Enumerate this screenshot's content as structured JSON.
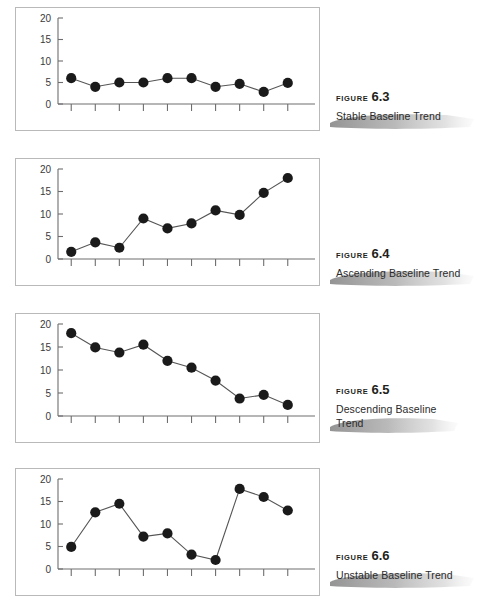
{
  "page": {
    "background_color": "#ffffff",
    "axis_color": "#6e6e6e",
    "frame_color": "#b9b9b9",
    "marker_color": "#1a1a1a",
    "line_color": "#555555",
    "brush_color": "#9a9a9a"
  },
  "figures": [
    {
      "figure_word": "FIGURE",
      "figure_number": "6.3",
      "title_lines": [
        "Stable Baseline Trend"
      ],
      "chart_data": {
        "type": "line",
        "title": "Stable Baseline Trend",
        "xlabel": "",
        "ylabel": "",
        "ylim": [
          0,
          20
        ],
        "yticks": [
          0,
          5,
          10,
          15,
          20
        ],
        "ytick_labels": [
          "0",
          "5",
          "10",
          "15",
          "20"
        ],
        "x": [
          1,
          2,
          3,
          4,
          5,
          6,
          7,
          8,
          9,
          10
        ],
        "xtick_count": 10,
        "xtick_labels": [
          "",
          "",
          "",
          "",
          "",
          "",
          "",
          "",
          "",
          ""
        ],
        "values": [
          6.0,
          4.0,
          5.0,
          5.0,
          6.0,
          6.0,
          4.0,
          4.7,
          2.8,
          4.9
        ],
        "grid": false,
        "legend": false,
        "markers": "filled-circle"
      }
    },
    {
      "figure_word": "FIGURE",
      "figure_number": "6.4",
      "title_lines": [
        "Ascending Baseline Trend"
      ],
      "chart_data": {
        "type": "line",
        "title": "Ascending Baseline Trend",
        "xlabel": "",
        "ylabel": "",
        "ylim": [
          0,
          20
        ],
        "yticks": [
          0,
          5,
          10,
          15,
          20
        ],
        "ytick_labels": [
          "0",
          "5",
          "10",
          "15",
          "20"
        ],
        "x": [
          1,
          2,
          3,
          4,
          5,
          6,
          7,
          8,
          9,
          10
        ],
        "xtick_count": 10,
        "xtick_labels": [
          "",
          "",
          "",
          "",
          "",
          "",
          "",
          "",
          "",
          ""
        ],
        "values": [
          1.6,
          3.7,
          2.5,
          9.0,
          6.8,
          7.9,
          10.8,
          9.8,
          14.7,
          18.0
        ],
        "grid": false,
        "legend": false,
        "markers": "filled-circle"
      }
    },
    {
      "figure_word": "FIGURE",
      "figure_number": "6.5",
      "title_lines": [
        "Descending Baseline",
        "Trend"
      ],
      "chart_data": {
        "type": "line",
        "title": "Descending Baseline Trend",
        "xlabel": "",
        "ylabel": "",
        "ylim": [
          0,
          20
        ],
        "yticks": [
          0,
          5,
          10,
          15,
          20
        ],
        "ytick_labels": [
          "0",
          "5",
          "10",
          "15",
          "20"
        ],
        "x": [
          1,
          2,
          3,
          4,
          5,
          6,
          7,
          8,
          9,
          10
        ],
        "xtick_count": 10,
        "xtick_labels": [
          "",
          "",
          "",
          "",
          "",
          "",
          "",
          "",
          "",
          ""
        ],
        "values": [
          18.0,
          14.9,
          13.8,
          15.5,
          12.0,
          10.5,
          7.7,
          3.8,
          4.6,
          2.4
        ],
        "grid": false,
        "legend": false,
        "markers": "filled-circle"
      }
    },
    {
      "figure_word": "FIGURE",
      "figure_number": "6.6",
      "title_lines": [
        "Unstable Baseline Trend"
      ],
      "chart_data": {
        "type": "line",
        "title": "Unstable Baseline Trend",
        "xlabel": "",
        "ylabel": "",
        "ylim": [
          0,
          20
        ],
        "yticks": [
          0,
          5,
          10,
          15,
          20
        ],
        "ytick_labels": [
          "0",
          "5",
          "10",
          "15",
          "20"
        ],
        "x": [
          1,
          2,
          3,
          4,
          5,
          6,
          7,
          8,
          9,
          10
        ],
        "xtick_count": 10,
        "xtick_labels": [
          "",
          "",
          "",
          "",
          "",
          "",
          "",
          "",
          "",
          ""
        ],
        "values": [
          4.9,
          12.6,
          14.5,
          7.2,
          7.9,
          3.2,
          2.0,
          17.8,
          16.0,
          13.0
        ],
        "grid": false,
        "legend": false,
        "markers": "filled-circle"
      }
    }
  ]
}
